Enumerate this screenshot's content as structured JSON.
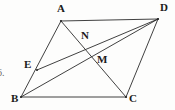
{
  "figure": {
    "kind": "plane-geometry-diagram",
    "shape": "parallelogram",
    "canvas": {
      "width": 175,
      "height": 110
    },
    "stroke_color": "#2b2b2b",
    "label_color": "#1b1b1b",
    "background_color": "#fdfdfc",
    "points": {
      "A": {
        "label": "A",
        "x": 61,
        "y": 21,
        "label_x": 57,
        "label_y": 3
      },
      "B": {
        "label": "B",
        "x": 21,
        "y": 97,
        "label_x": 11,
        "label_y": 93
      },
      "C": {
        "label": "C",
        "x": 126,
        "y": 97,
        "label_x": 129,
        "label_y": 93
      },
      "D": {
        "label": "D",
        "x": 158,
        "y": 19,
        "label_x": 160,
        "label_y": 2
      },
      "E": {
        "label": "E",
        "x": 37,
        "y": 70,
        "label_x": 24,
        "label_y": 59
      },
      "M": {
        "label": "M",
        "x": 93,
        "y": 57,
        "label_x": 97,
        "label_y": 54
      },
      "N": {
        "label": "N",
        "x": 86,
        "y": 47,
        "label_x": 81,
        "label_y": 30
      }
    },
    "segments": [
      {
        "name": "side-AD",
        "from": "A",
        "to": "D"
      },
      {
        "name": "side-AB",
        "from": "A",
        "to": "B"
      },
      {
        "name": "side-BC",
        "from": "B",
        "to": "C"
      },
      {
        "name": "side-CD",
        "from": "C",
        "to": "D"
      },
      {
        "name": "diagonal-AC",
        "from": "A",
        "to": "C"
      },
      {
        "name": "diagonal-BD",
        "from": "B",
        "to": "D"
      },
      {
        "name": "cevian-ED",
        "from": "E",
        "to": "D"
      }
    ],
    "stray_text": {
      "value": "6.",
      "x": -3,
      "y": 68
    }
  }
}
